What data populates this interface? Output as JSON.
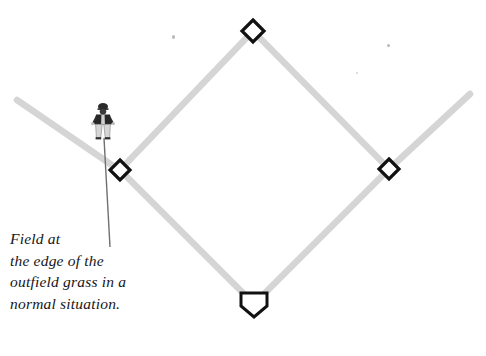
{
  "diagram": {
    "caption_lines": [
      "Field at",
      "the edge of the",
      "outfield grass in a",
      "normal situation."
    ],
    "colors": {
      "baseline": "#d5d5d5",
      "base_outline": "#111111",
      "base_fill": "#ffffff",
      "leader_line": "#6f6f74",
      "text": "#16161a",
      "figure_dark": "#2a2a2a",
      "figure_light": "#d8d8d8",
      "background": "#ffffff"
    },
    "bases": [
      {
        "name": "second-base",
        "label": "2B",
        "shape": "diamond",
        "x": 253,
        "y": 31,
        "size": 22
      },
      {
        "name": "first-base",
        "label": "1B",
        "shape": "diamond",
        "x": 389,
        "y": 169,
        "size": 21
      },
      {
        "name": "third-base",
        "label": "3B",
        "shape": "diamond",
        "x": 120,
        "y": 170,
        "size": 21
      },
      {
        "name": "home-plate",
        "label": "H",
        "shape": "pentagon",
        "x": 254,
        "y": 304,
        "size": 26
      }
    ],
    "baselines": [
      {
        "name": "third-to-second",
        "x1": 120,
        "y1": 170,
        "x2": 253,
        "y2": 31
      },
      {
        "name": "second-to-first",
        "x1": 253,
        "y1": 31,
        "x2": 389,
        "y2": 169
      },
      {
        "name": "first-to-home",
        "x1": 389,
        "y1": 169,
        "x2": 254,
        "y2": 304
      },
      {
        "name": "home-to-third",
        "x1": 254,
        "y1": 304,
        "x2": 120,
        "y2": 170
      }
    ],
    "foul_lines": [
      {
        "name": "left-field-foul-line",
        "x1": 120,
        "y1": 170,
        "x2": 17,
        "y2": 100
      },
      {
        "name": "right-field-foul-line",
        "x1": 389,
        "y1": 169,
        "x2": 470,
        "y2": 94
      }
    ],
    "player": {
      "name": "fielder-figure",
      "x": 103,
      "y": 121,
      "description": "fielder standing at edge of outfield grass"
    },
    "leader_line": {
      "name": "caption-leader-line",
      "x1": 105,
      "y1": 139,
      "x2": 110,
      "y2": 246
    },
    "specks": [
      {
        "x": 173,
        "y": 36,
        "size": 3
      },
      {
        "x": 388,
        "y": 45,
        "size": 3
      },
      {
        "x": 357,
        "y": 73,
        "size": 2
      }
    ]
  }
}
